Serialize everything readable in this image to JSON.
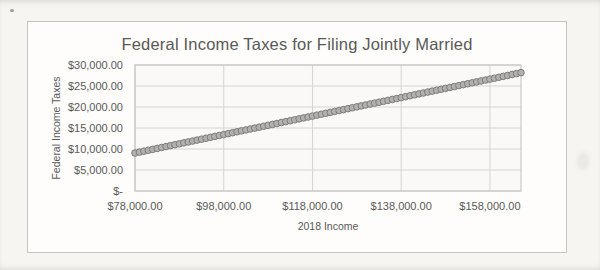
{
  "colors": {
    "text": "#595957",
    "gridline": "#d6d4d1",
    "axis": "#c2c0bc",
    "plot_fill": "#faf9f7",
    "marker_fill": "#b2b1af",
    "marker_stroke": "#7d7c7a",
    "chart_background": "#fefdfc",
    "page_background": "#f6f5f2"
  },
  "chart_data": {
    "type": "scatter",
    "title": "Federal Income Taxes for Filing Jointly Married",
    "xlabel": "2018 Income",
    "ylabel": "Federal Income Taxes",
    "xlim": [
      78000,
      165000
    ],
    "ylim": [
      0,
      30000
    ],
    "grid": true,
    "legend": false,
    "x_ticks": [
      {
        "value": 78000,
        "label": "$78,000.00"
      },
      {
        "value": 98000,
        "label": "$98,000.00"
      },
      {
        "value": 118000,
        "label": "$118,000.00"
      },
      {
        "value": 138000,
        "label": "$138,000.00"
      },
      {
        "value": 158000,
        "label": "$158,000.00"
      }
    ],
    "y_ticks": [
      {
        "value": 0,
        "label": "$-"
      },
      {
        "value": 5000,
        "label": "$5,000.00"
      },
      {
        "value": 10000,
        "label": "$10,000.00"
      },
      {
        "value": 15000,
        "label": "$15,000.00"
      },
      {
        "value": 20000,
        "label": "$20,000.00"
      },
      {
        "value": 25000,
        "label": "$25,000.00"
      },
      {
        "value": 30000,
        "label": "$30,000.00"
      }
    ],
    "series": [
      {
        "marker": "circle",
        "x": [
          78000,
          79000,
          80000,
          81000,
          82000,
          83000,
          84000,
          85000,
          86000,
          87000,
          88000,
          89000,
          90000,
          91000,
          92000,
          93000,
          94000,
          95000,
          96000,
          97000,
          98000,
          99000,
          100000,
          101000,
          102000,
          103000,
          104000,
          105000,
          106000,
          107000,
          108000,
          109000,
          110000,
          111000,
          112000,
          113000,
          114000,
          115000,
          116000,
          117000,
          118000,
          119000,
          120000,
          121000,
          122000,
          123000,
          124000,
          125000,
          126000,
          127000,
          128000,
          129000,
          130000,
          131000,
          132000,
          133000,
          134000,
          135000,
          136000,
          137000,
          138000,
          139000,
          140000,
          141000,
          142000,
          143000,
          144000,
          145000,
          146000,
          147000,
          148000,
          149000,
          150000,
          151000,
          152000,
          153000,
          154000,
          155000,
          156000,
          157000,
          158000,
          159000,
          160000,
          161000,
          162000,
          163000,
          164000,
          165000
        ],
        "y": [
          9039,
          9259,
          9479,
          9699,
          9919,
          10139,
          10359,
          10579,
          10799,
          11019,
          11239,
          11459,
          11679,
          11899,
          12119,
          12339,
          12559,
          12779,
          12999,
          13219,
          13439,
          13659,
          13879,
          14099,
          14319,
          14539,
          14759,
          14979,
          15199,
          15419,
          15639,
          15859,
          16079,
          16299,
          16519,
          16739,
          16959,
          17179,
          17399,
          17619,
          17839,
          18059,
          18279,
          18499,
          18719,
          18939,
          19159,
          19379,
          19599,
          19819,
          20039,
          20259,
          20479,
          20699,
          20919,
          21139,
          21359,
          21579,
          21799,
          22019,
          22239,
          22459,
          22679,
          22899,
          23119,
          23339,
          23559,
          23779,
          23999,
          24219,
          24439,
          24659,
          24879,
          25099,
          25319,
          25539,
          25759,
          25979,
          26199,
          26419,
          26639,
          26859,
          27079,
          27299,
          27519,
          27739,
          27959,
          28179
        ]
      }
    ]
  }
}
